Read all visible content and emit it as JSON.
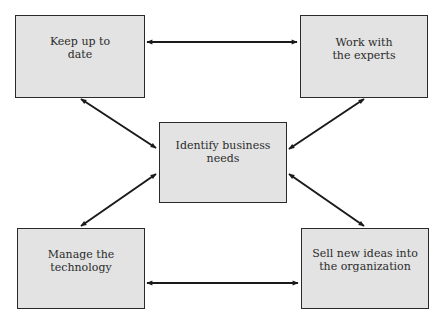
{
  "diagram": {
    "type": "hub-and-spoke",
    "colors": {
      "box_fill": "#e3e3e3",
      "box_border": "#2a2a2a",
      "arrow": "#1a1a1a",
      "text": "#2b2b2b"
    },
    "nodes": {
      "top_left": {
        "lines": [
          "Keep up to",
          "date"
        ]
      },
      "top_right": {
        "lines": [
          "Work with",
          "the experts"
        ]
      },
      "center": {
        "lines": [
          "Identify business",
          "needs"
        ]
      },
      "bottom_left": {
        "lines": [
          "Manage the",
          "technology"
        ]
      },
      "bottom_right": {
        "lines": [
          "Sell new ideas into",
          "the organization"
        ]
      }
    },
    "edges": [
      {
        "from": "top_left",
        "to": "top_right",
        "direction": "both"
      },
      {
        "from": "top_left",
        "to": "center",
        "direction": "both"
      },
      {
        "from": "top_right",
        "to": "center",
        "direction": "both"
      },
      {
        "from": "bottom_left",
        "to": "center",
        "direction": "both"
      },
      {
        "from": "bottom_right",
        "to": "center",
        "direction": "both"
      },
      {
        "from": "bottom_left",
        "to": "bottom_right",
        "direction": "both"
      }
    ]
  }
}
